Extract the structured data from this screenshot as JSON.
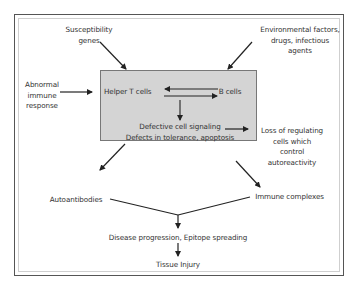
{
  "diagram": {
    "nodes": {
      "susceptibility": [
        "Susceptibility",
        "genes"
      ],
      "environmental": [
        "Environmental factors,",
        "drugs, infectious",
        "agents"
      ],
      "abnormal": [
        "Abnormal",
        "immune",
        "response"
      ],
      "helper_t": "Helper T cells",
      "b_cells": "B cells",
      "defective": [
        "Defective cell signaling",
        "Defects in tolerance, apoptosis"
      ],
      "loss": [
        "Loss  of regulating",
        "cells which",
        "control",
        "autoreactivity"
      ],
      "autoantibodies": "Autoantibodies",
      "immune_complexes": "Immune complexes",
      "disease_progression": "Disease progression, Epitope spreading",
      "tissue_injury": "Tissue Injury"
    },
    "colors": {
      "core_box_fill": "#d4d4d4",
      "arrow": "#222222"
    }
  }
}
